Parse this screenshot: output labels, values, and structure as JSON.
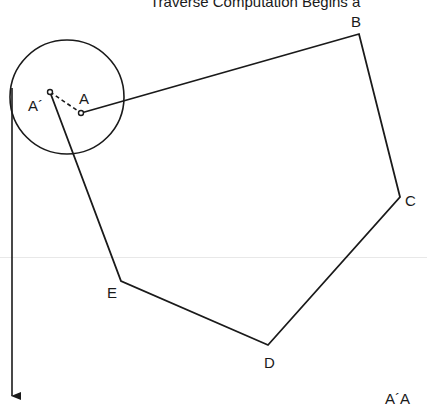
{
  "title": "Traverse Computation Begins a",
  "diagram": {
    "type": "closed-traverse-error",
    "stations": [
      {
        "name": "A",
        "x": 81,
        "y": 113
      },
      {
        "name": "B",
        "x": 359,
        "y": 34
      },
      {
        "name": "C",
        "x": 400,
        "y": 197
      },
      {
        "name": "D",
        "x": 268,
        "y": 345
      },
      {
        "name": "E",
        "x": 121,
        "y": 281
      }
    ],
    "closing_point": {
      "name": "A´",
      "x": 50,
      "y": 92
    },
    "labels": {
      "a_prime": "A´",
      "a": "A",
      "b": "B",
      "c": "C",
      "d": "D",
      "e": "E",
      "footnote": "A´A"
    },
    "error_circle": {
      "cx": 67,
      "cy": 97,
      "r": 57
    },
    "arrow": {
      "x": 12,
      "y1": 92,
      "y2": 400,
      "direction": "down"
    },
    "colors": {
      "line": "#1a1a1a",
      "background": "#ffffff"
    }
  }
}
